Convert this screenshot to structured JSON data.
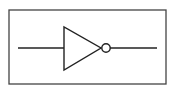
{
  "diagram": {
    "type": "logic-gate",
    "gate": "NOT",
    "stroke_color": "#222222",
    "background": "#ffffff"
  }
}
